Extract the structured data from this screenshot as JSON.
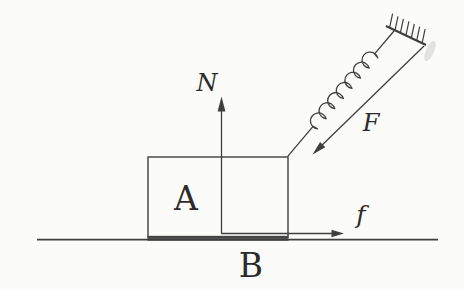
{
  "figure": {
    "background_color": "#fbfbf9",
    "line_color": "#3f3f3f",
    "text_color": "#2b2b2b",
    "shadow_color": "#c9c9c9",
    "labels": {
      "normal_force": "N",
      "applied_force": "F",
      "friction_force": "f",
      "block": "A",
      "ground": "B"
    }
  }
}
